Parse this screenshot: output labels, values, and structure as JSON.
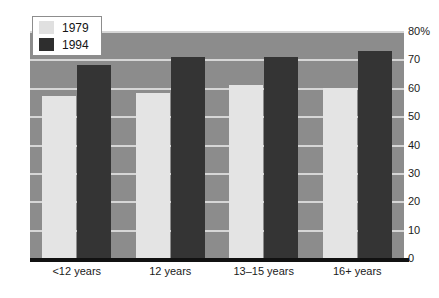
{
  "chart_data": {
    "type": "bar",
    "title": "",
    "subtitle": "",
    "xlabel": "",
    "ylabel": "",
    "categories": [
      "<12 years",
      "12 years",
      "13–15 years",
      "16+ years"
    ],
    "series": [
      {
        "name": "1979",
        "color": "#e4e4e4",
        "values": [
          57,
          58,
          61,
          60
        ]
      },
      {
        "name": "1994",
        "color": "#343434",
        "values": [
          68,
          71,
          71,
          73
        ]
      }
    ],
    "ylim": [
      0,
      80
    ],
    "ytick_values": [
      80,
      70,
      60,
      50,
      40,
      30,
      20,
      10,
      0
    ],
    "ytick_labels": [
      "80%",
      "70",
      "60",
      "50",
      "40",
      "30",
      "20",
      "10",
      "0"
    ],
    "grid": true,
    "grid_orientation": "horizontal",
    "legend_position": "top-left",
    "plot_background": "#8c8c8c",
    "gridline_color": "#d6d6d6",
    "axis_color": "#111111"
  },
  "legend": {
    "items": [
      {
        "label": "1979",
        "swatch": "light"
      },
      {
        "label": "1994",
        "swatch": "dark"
      }
    ]
  },
  "axis": {
    "y_labels": [
      "80%",
      "70",
      "60",
      "50",
      "40",
      "30",
      "20",
      "10",
      "0"
    ],
    "x_labels": [
      "<12 years",
      "12 years",
      "13–15 years",
      "16+ years"
    ]
  }
}
